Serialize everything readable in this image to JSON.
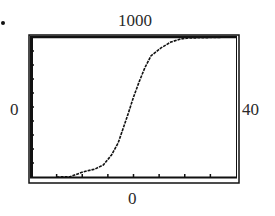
{
  "window": {
    "ymax_label": "1000",
    "ymin_label": "0",
    "xmin_label": "0",
    "xmax_label": "40"
  },
  "chart_data": {
    "type": "line",
    "title": "",
    "xlabel": "",
    "ylabel": "",
    "xlim": [
      0,
      40
    ],
    "ylim": [
      0,
      1000
    ],
    "xscale_ticks": [
      5,
      10,
      15,
      20,
      25,
      30,
      35
    ],
    "yscale_ticks": [
      100,
      200,
      300,
      400,
      500,
      600,
      700,
      800,
      900
    ],
    "grid": false,
    "legend": null,
    "series": [
      {
        "name": "logistic",
        "style": "dotted-pixel",
        "x": [
          5,
          7.6,
          10.1,
          12.5,
          14.1,
          15.7,
          17.0,
          18.0,
          19.0,
          20.0,
          21.1,
          22.2,
          23.4,
          25.3,
          27.3,
          29.2,
          30.7,
          40
        ],
        "y": [
          0,
          2,
          36,
          57,
          86,
          157,
          243,
          350,
          457,
          571,
          679,
          779,
          864,
          921,
          964,
          986,
          993,
          1000
        ]
      }
    ]
  }
}
